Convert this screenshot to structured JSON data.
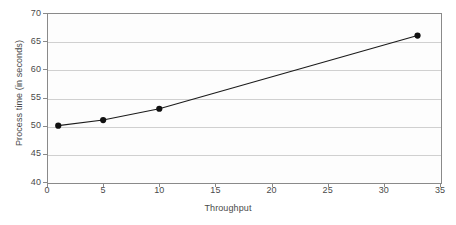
{
  "chart_data": {
    "type": "line",
    "title": "",
    "subtitle": "",
    "xlabel": "Throughput",
    "ylabel": "Process time (in seconds)",
    "x": [
      1,
      5,
      10,
      33
    ],
    "values": [
      50,
      51,
      53,
      66
    ],
    "series": [
      {
        "name": "Process time",
        "x": [
          1,
          5,
          10,
          33
        ],
        "values": [
          50,
          51,
          53,
          66
        ]
      }
    ],
    "xlim": [
      0,
      35
    ],
    "ylim": [
      40,
      70
    ],
    "x_ticks": [
      0,
      5,
      10,
      15,
      20,
      25,
      30,
      35
    ],
    "y_ticks": [
      40,
      45,
      50,
      55,
      60,
      65,
      70
    ],
    "x_tick_labels": [
      "0",
      "5",
      "10",
      "15",
      "20",
      "25",
      "30",
      "35"
    ],
    "y_tick_labels": [
      "40",
      "45",
      "50",
      "55",
      "60",
      "65",
      "70"
    ],
    "grid": {
      "horizontal": true,
      "vertical": false
    },
    "legend": {
      "visible": false,
      "position": "none",
      "entries": []
    },
    "annotations": [],
    "marker": {
      "shape": "circle",
      "filled": true,
      "size": 5
    },
    "colors": {
      "line": "#1b1b1b",
      "marker": "#111111",
      "gridline": "#d0d0d0",
      "axis": "#8a8a8a",
      "plot_background": "#fdfdfd",
      "figure_background": "#ffffff",
      "text": "#4a4a4a"
    }
  }
}
